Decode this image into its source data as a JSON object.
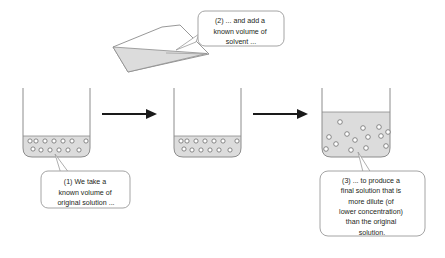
{
  "diagram": {
    "type": "process-diagram",
    "steps": 3,
    "colors": {
      "liquid_fill": "#dcdcdc",
      "vessel_stroke": "#8c8c8c",
      "particle_fill": "#ffffff",
      "particle_stroke": "#6e6e6e",
      "arrow": "#1a1a1a",
      "callout_fill": "#ffffff",
      "callout_stroke": "#9a9a9a",
      "text": "#231f20"
    }
  },
  "callouts": [
    {
      "id": "callout-1",
      "number": "(1)",
      "lines": [
        "(1) We take a",
        "known volume of",
        "original solution ..."
      ],
      "full_text": "(1) We take a known volume of original solution ..."
    },
    {
      "id": "callout-2",
      "number": "(2)",
      "lines": [
        "(2) ... and add a",
        "known volume of",
        "solvent ..."
      ],
      "full_text": "(2) ... and add a known volume of solvent ..."
    },
    {
      "id": "callout-3",
      "number": "(3)",
      "lines": [
        "(3) ... to produce a",
        "final solution that is",
        "more dilute (of",
        "lower concentration)",
        "than the original",
        "solution."
      ],
      "full_text": "(3) ... to produce a final solution that is more dilute (of lower concentration) than the original solution."
    }
  ],
  "vessels": [
    {
      "id": "beaker-1",
      "label": "original solution beaker",
      "liquid_level": "low",
      "particle_count": 13,
      "particles": [
        [
          7,
          4
        ],
        [
          13,
          4
        ],
        [
          22,
          4
        ],
        [
          31,
          4
        ],
        [
          40,
          4
        ],
        [
          49,
          4
        ],
        [
          62,
          4
        ],
        [
          10,
          12
        ],
        [
          18,
          13
        ],
        [
          27,
          13
        ],
        [
          36,
          13
        ],
        [
          45,
          13
        ],
        [
          56,
          13
        ]
      ]
    },
    {
      "id": "beaker-2",
      "label": "solution beaker before dilution",
      "liquid_level": "low",
      "particle_count": 13,
      "particles": [
        [
          7,
          4
        ],
        [
          13,
          4
        ],
        [
          22,
          4
        ],
        [
          31,
          4
        ],
        [
          40,
          4
        ],
        [
          49,
          4
        ],
        [
          62,
          4
        ],
        [
          10,
          12
        ],
        [
          18,
          13
        ],
        [
          27,
          13
        ],
        [
          36,
          13
        ],
        [
          45,
          13
        ],
        [
          56,
          13
        ]
      ]
    },
    {
      "id": "beaker-3",
      "label": "diluted final solution beaker",
      "liquid_level": "high",
      "particle_count": 14,
      "particles": [
        [
          18,
          9
        ],
        [
          41,
          15
        ],
        [
          57,
          14
        ],
        [
          7,
          24
        ],
        [
          25,
          21
        ],
        [
          33,
          27
        ],
        [
          46,
          24
        ],
        [
          59,
          23
        ],
        [
          14,
          31
        ],
        [
          29,
          37
        ],
        [
          44,
          35
        ],
        [
          66,
          32
        ],
        [
          4,
          36
        ],
        [
          67,
          19
        ]
      ]
    },
    {
      "id": "pouring-vessel",
      "label": "tilted beaker adding solvent",
      "liquid_level": "tilted"
    }
  ],
  "arrows": [
    {
      "id": "arrow-1",
      "direction": "right",
      "label": "step 1 to step 2"
    },
    {
      "id": "arrow-2",
      "direction": "right",
      "label": "step 2 to step 3"
    }
  ]
}
